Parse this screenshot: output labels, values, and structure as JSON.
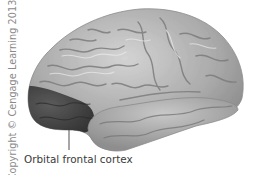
{
  "figure": {
    "highlighted_region": "orbital-frontal-cortex",
    "colors": {
      "brain_base": "#a8a8a8",
      "brain_light": "#d9d9d9",
      "brain_shadow": "#7d7d7d",
      "highlight_region": "#4a4a4a",
      "leader_line": "#3a3a3a",
      "label_text": "#3a3a3a",
      "copyright_text": "#8a8a8a"
    }
  },
  "labels": {
    "region_label": "Orbital frontal cortex"
  },
  "copyright": "Copyright © Cengage Learning 2013"
}
